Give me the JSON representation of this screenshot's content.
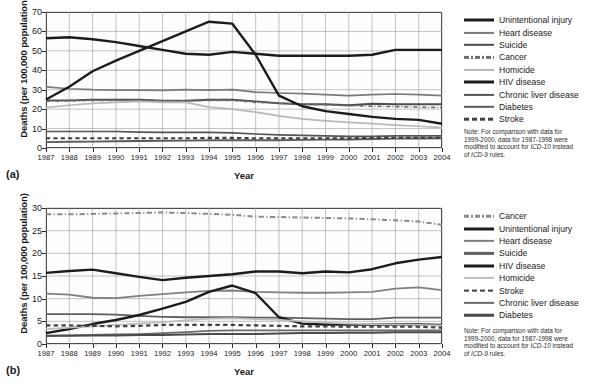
{
  "figure": {
    "axis_titles": {
      "x": "Year",
      "y": "Deaths (per 100,000 population)"
    },
    "note_lines": [
      "Note: For comparison with data for",
      "1999-2000, data for 1987-1998 were",
      "modified to account for ICD-10 instead",
      "of ICD-9 rules."
    ]
  },
  "panels": [
    {
      "tag": "(a)"
    },
    {
      "tag": "(b)"
    }
  ],
  "chart_data": [
    {
      "type": "line",
      "panel": "(a)",
      "title": "",
      "xlabel": "Year",
      "ylabel": "Deaths (per 100,000 population)",
      "xlim": [
        1987,
        2004
      ],
      "ylim": [
        0,
        70
      ],
      "ytick_values": [
        0,
        10,
        20,
        30,
        40,
        50,
        60,
        70
      ],
      "grid": true,
      "legend_position": "right",
      "x": [
        1987,
        1988,
        1989,
        1990,
        1991,
        1992,
        1993,
        1994,
        1995,
        1996,
        1997,
        1998,
        1999,
        2000,
        2001,
        2002,
        2003,
        2004
      ],
      "series": [
        {
          "name": "Unintentional injury",
          "color": "#1c1c1c",
          "width": 2.4,
          "dash": "none",
          "values": [
            56.5,
            57.0,
            56.0,
            54.5,
            52.5,
            50.5,
            48.5,
            48.0,
            49.5,
            48.5,
            47.5,
            47.5,
            47.5,
            47.5,
            48.0,
            50.5,
            50.5,
            50.5
          ]
        },
        {
          "name": "Heart disease",
          "color": "#7a7a7a",
          "width": 1.7,
          "dash": "none",
          "values": [
            31.5,
            30.5,
            30.0,
            29.8,
            29.8,
            29.7,
            30.0,
            29.8,
            30.0,
            28.8,
            28.3,
            28.0,
            27.5,
            27.0,
            27.5,
            27.8,
            27.5,
            27.0
          ]
        },
        {
          "name": "Suicide",
          "color": "#4d4d4d",
          "width": 1.9,
          "dash": "none",
          "values": [
            24.5,
            24.5,
            24.8,
            24.8,
            24.8,
            24.3,
            24.3,
            24.8,
            24.8,
            24.0,
            23.0,
            22.5,
            22.5,
            22.0,
            22.8,
            22.5,
            22.5,
            22.5
          ]
        },
        {
          "name": "Cancer",
          "color": "#6d6d6d",
          "width": 1.6,
          "dash": "dashdot",
          "values": [
            24.0,
            24.2,
            24.5,
            24.5,
            24.5,
            24.3,
            24.3,
            24.5,
            24.5,
            23.5,
            23.0,
            22.5,
            22.2,
            21.8,
            21.5,
            21.3,
            21.0,
            20.8
          ]
        },
        {
          "name": "Homicide",
          "color": "#b8b8b8",
          "width": 1.7,
          "dash": "none",
          "values": [
            20.8,
            22.0,
            23.0,
            23.5,
            24.0,
            23.5,
            23.5,
            21.0,
            20.0,
            18.5,
            16.5,
            15.0,
            14.0,
            13.2,
            12.5,
            11.8,
            11.2,
            10.5
          ]
        },
        {
          "name": "HIV disease",
          "color": "#1c1c1c",
          "width": 2.4,
          "dash": "none",
          "values": [
            25.0,
            31.5,
            39.5,
            45.0,
            50.0,
            55.0,
            60.0,
            65.0,
            64.0,
            48.0,
            27.0,
            21.5,
            19.0,
            17.5,
            16.0,
            15.0,
            14.5,
            12.5
          ]
        },
        {
          "name": "Chronic liver disease",
          "color": "#555555",
          "width": 1.7,
          "dash": "none",
          "values": [
            8.5,
            8.5,
            8.5,
            8.5,
            8.2,
            8.0,
            8.0,
            8.0,
            7.8,
            7.2,
            6.8,
            6.5,
            6.2,
            6.0,
            6.0,
            6.2,
            6.2,
            6.2
          ]
        },
        {
          "name": "Diabetes",
          "color": "#5a5a5a",
          "width": 1.9,
          "dash": "none",
          "values": [
            3.0,
            3.2,
            3.3,
            3.5,
            3.6,
            3.7,
            3.8,
            4.0,
            4.0,
            4.0,
            4.0,
            4.2,
            4.3,
            4.4,
            4.6,
            4.8,
            4.9,
            5.0
          ]
        },
        {
          "name": "Stroke",
          "color": "#3f3f3f",
          "width": 2.1,
          "dash": "dashed",
          "values": [
            5.0,
            5.0,
            5.0,
            5.0,
            5.0,
            5.0,
            5.0,
            5.2,
            5.2,
            5.0,
            5.0,
            5.0,
            5.0,
            5.0,
            5.2,
            5.2,
            5.2,
            5.2
          ]
        }
      ],
      "legend": [
        "Unintentional injury",
        "Heart disease",
        "Suicide",
        "Cancer",
        "Homicide",
        "HIV disease",
        "Chronic liver disease",
        "Diabetes",
        "Stroke"
      ]
    },
    {
      "type": "line",
      "panel": "(b)",
      "title": "",
      "xlabel": "Year",
      "ylabel": "Deaths (per 100,000 population)",
      "xlim": [
        1987,
        2004
      ],
      "ylim": [
        0,
        30
      ],
      "ytick_values": [
        0,
        5,
        10,
        15,
        20,
        25,
        30
      ],
      "grid": true,
      "legend_position": "right",
      "x": [
        1987,
        1988,
        1989,
        1990,
        1991,
        1992,
        1993,
        1994,
        1995,
        1996,
        1997,
        1998,
        1999,
        2000,
        2001,
        2002,
        2003,
        2004
      ],
      "series": [
        {
          "name": "Cancer",
          "color": "#8a8a8a",
          "width": 2.0,
          "dash": "dashdot",
          "values": [
            28.6,
            28.6,
            28.7,
            28.8,
            28.9,
            29.0,
            28.9,
            28.7,
            28.5,
            28.1,
            28.0,
            27.9,
            27.8,
            27.7,
            27.5,
            27.3,
            27.0,
            26.3
          ]
        },
        {
          "name": "Unintentional injury",
          "color": "#1c1c1c",
          "width": 2.4,
          "dash": "none",
          "values": [
            15.7,
            16.1,
            16.4,
            15.6,
            14.8,
            14.1,
            14.6,
            15.0,
            15.4,
            16.0,
            16.0,
            15.6,
            16.0,
            15.8,
            16.5,
            17.8,
            18.6,
            19.2
          ]
        },
        {
          "name": "Heart disease",
          "color": "#808080",
          "width": 1.8,
          "dash": "none",
          "values": [
            11.1,
            10.9,
            10.2,
            10.1,
            10.6,
            11.0,
            11.4,
            11.7,
            11.8,
            11.5,
            11.4,
            11.3,
            11.3,
            11.4,
            11.5,
            12.2,
            12.5,
            11.9
          ]
        },
        {
          "name": "Suicide",
          "color": "#5f5f5f",
          "width": 1.8,
          "dash": "none",
          "values": [
            6.6,
            6.6,
            6.6,
            6.5,
            6.2,
            6.0,
            5.9,
            5.9,
            5.9,
            5.8,
            5.8,
            5.7,
            5.6,
            5.5,
            5.5,
            5.8,
            5.8,
            5.8
          ]
        },
        {
          "name": "HIV disease",
          "color": "#1c1c1c",
          "width": 2.4,
          "dash": "none",
          "values": [
            2.4,
            3.3,
            4.4,
            5.3,
            6.4,
            7.8,
            9.3,
            11.5,
            12.9,
            11.2,
            5.9,
            4.5,
            4.3,
            4.3,
            4.3,
            4.3,
            4.3,
            4.2
          ]
        },
        {
          "name": "Homicide",
          "color": "#bdbdbd",
          "width": 1.7,
          "dash": "none",
          "values": [
            3.3,
            3.6,
            3.9,
            4.2,
            4.5,
            4.8,
            5.2,
            5.6,
            5.7,
            5.5,
            5.3,
            5.0,
            4.7,
            4.5,
            4.4,
            4.3,
            4.2,
            4.1
          ]
        },
        {
          "name": "Stroke",
          "color": "#3f3f3f",
          "width": 2.2,
          "dash": "dashed",
          "values": [
            4.1,
            4.1,
            4.0,
            3.9,
            4.0,
            4.2,
            4.2,
            4.2,
            4.2,
            4.1,
            4.0,
            3.9,
            3.9,
            3.8,
            3.8,
            3.8,
            3.8,
            3.6
          ]
        },
        {
          "name": "Chronic liver disease",
          "color": "#6a6a6a",
          "width": 1.8,
          "dash": "none",
          "values": [
            1.8,
            1.9,
            2.0,
            2.1,
            2.2,
            2.4,
            2.6,
            2.9,
            3.0,
            3.0,
            3.0,
            3.0,
            3.0,
            3.0,
            3.0,
            3.0,
            3.0,
            3.0
          ]
        },
        {
          "name": "Diabetes",
          "color": "#4a4a4a",
          "width": 2.0,
          "dash": "none",
          "values": [
            1.8,
            1.8,
            1.9,
            1.9,
            2.0,
            2.0,
            2.1,
            2.2,
            2.2,
            2.2,
            2.3,
            2.4,
            2.4,
            2.5,
            2.5,
            2.6,
            2.6,
            2.6
          ]
        }
      ],
      "legend": [
        "Cancer",
        "Unintentional injury",
        "Heart disease",
        "Suicide",
        "HIV disease",
        "Homicide",
        "Stroke",
        "Chronic liver disease",
        "Diabetes"
      ]
    }
  ]
}
